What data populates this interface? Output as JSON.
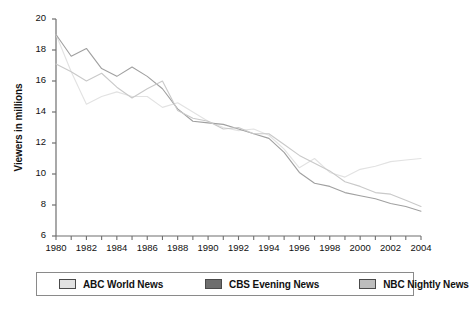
{
  "chart_data": {
    "type": "line",
    "title": "",
    "subtitle": "",
    "xlabel": "",
    "ylabel": "Viewers in millions",
    "xlim": [
      1980,
      2004
    ],
    "ylim": [
      6,
      20
    ],
    "grid": false,
    "legend_position": "bottom",
    "x": [
      1980,
      1981,
      1982,
      1983,
      1984,
      1985,
      1986,
      1987,
      1988,
      1989,
      1990,
      1991,
      1992,
      1993,
      1994,
      1995,
      1996,
      1997,
      1998,
      1999,
      2000,
      2001,
      2002,
      2003,
      2004
    ],
    "yticks": [
      6,
      8,
      10,
      12,
      14,
      16,
      18,
      20
    ],
    "xticks": [
      1980,
      1982,
      1984,
      1986,
      1988,
      1990,
      1992,
      1994,
      1996,
      1998,
      2000,
      2002,
      2004
    ],
    "xtick_labels": [
      "1980",
      "1982",
      "1984",
      "1986",
      "1988",
      "1990",
      "1992",
      "1994",
      "1996",
      "1998",
      "2000",
      "2002",
      "2004"
    ],
    "ytick_labels": [
      "6",
      "8",
      "10",
      "12",
      "14",
      "16",
      "18",
      "20"
    ],
    "series": [
      {
        "name": "ABC World News",
        "color": "#e2e2e2",
        "values": [
          19.0,
          16.6,
          14.5,
          15.0,
          15.3,
          15.0,
          15.0,
          14.3,
          14.6,
          14.0,
          13.4,
          13.0,
          12.8,
          12.9,
          12.5,
          11.6,
          10.4,
          11.0,
          10.1,
          9.8,
          10.3,
          10.5,
          10.8,
          10.9,
          11.0
        ]
      },
      {
        "name": "CBS Evening News",
        "color": "#a0a0a0",
        "values": [
          19.0,
          17.6,
          18.1,
          16.8,
          16.3,
          16.9,
          16.3,
          15.5,
          14.2,
          13.4,
          13.3,
          13.2,
          12.9,
          12.6,
          12.3,
          11.4,
          10.1,
          9.4,
          9.2,
          8.8,
          8.6,
          8.4,
          8.1,
          7.9,
          7.6
        ]
      },
      {
        "name": "NBC Nightly News",
        "color": "#c9c9c9",
        "values": [
          17.1,
          16.6,
          16.0,
          16.5,
          15.6,
          14.9,
          15.5,
          16.0,
          14.1,
          13.6,
          13.4,
          12.9,
          13.0,
          12.6,
          12.6,
          11.9,
          11.2,
          10.7,
          10.2,
          9.5,
          9.2,
          8.8,
          8.7,
          8.3,
          7.9
        ]
      }
    ]
  },
  "axis": {
    "y_title": "Viewers in millions"
  },
  "legend": {
    "items": [
      {
        "label": "ABC World News",
        "color": "#e2e2e2"
      },
      {
        "label": "CBS Evening News",
        "color": "#6e6e6e"
      },
      {
        "label": "NBC Nightly News",
        "color": "#bdbdbd"
      }
    ]
  }
}
